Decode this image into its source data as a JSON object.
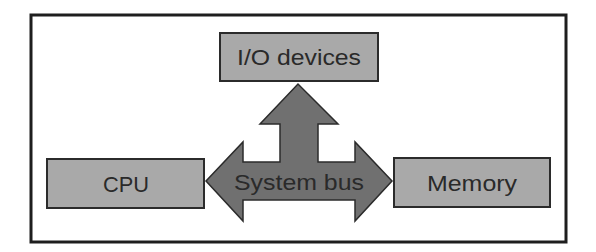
{
  "diagram": {
    "nodes": [
      {
        "id": "io",
        "label": "I/O devices"
      },
      {
        "id": "cpu",
        "label": "CPU"
      },
      {
        "id": "memory",
        "label": "Memory"
      }
    ],
    "bus": {
      "label": "System bus"
    },
    "edges": [
      {
        "from": "bus",
        "to": "io",
        "direction": "bidirectional"
      },
      {
        "from": "bus",
        "to": "cpu",
        "direction": "bidirectional"
      },
      {
        "from": "bus",
        "to": "memory",
        "direction": "bidirectional"
      }
    ],
    "colors": {
      "box_fill": "#a9a9a9",
      "arrow_fill": "#707070",
      "outline": "#2b2b2b",
      "text": "#2a2a2a"
    }
  }
}
